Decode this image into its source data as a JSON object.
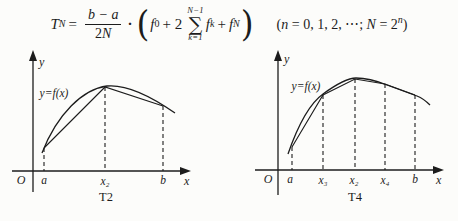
{
  "formula": {
    "lhs_var": "T",
    "lhs_sub": "N",
    "equals": "=",
    "frac_num": "b − a",
    "frac_den_coef": "2",
    "frac_den_var": "N",
    "cdot": "·",
    "lparen": "(",
    "f0_var": "f",
    "f0_sub": "0",
    "plus_two": "+ 2",
    "sum_upper": "N−1",
    "sum_sigma": "∑",
    "sum_lower": "k=1",
    "fk_var": "f",
    "fk_sub": "k",
    "plus": "+",
    "fN_var": "f",
    "fN_sub": "N",
    "rparen": ")",
    "cond_open": "(",
    "cond_n": "n",
    "cond_list": " = 0, 1, 2, ⋯;  ",
    "cond_N": "N",
    "cond_eq2": " = 2",
    "cond_exp": "n",
    "cond_close": ")"
  },
  "graphs": [
    {
      "caption": "T2",
      "curve_label": "y=f(x)",
      "y_label": "y",
      "x_label": "x",
      "origin": "O",
      "ticks": [
        "a",
        "x₂",
        "b"
      ]
    },
    {
      "caption": "T4",
      "curve_label": "y=f(x)",
      "y_label": "y",
      "x_label": "x",
      "origin": "O",
      "ticks": [
        "a",
        "x₃",
        "x₂",
        "x₄",
        "b"
      ]
    }
  ]
}
